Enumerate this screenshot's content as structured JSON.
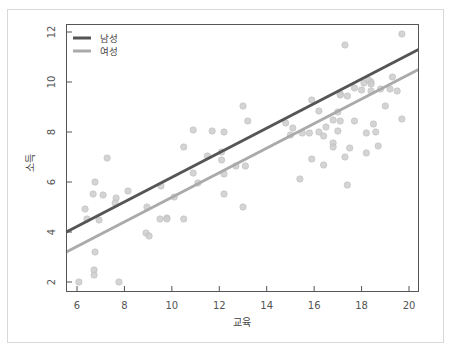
{
  "chart_data": {
    "type": "scatter",
    "title": "",
    "xlabel": "교육",
    "ylabel": "소득",
    "xlim": [
      5.55,
      20.4
    ],
    "ylim": [
      1.6,
      12.3
    ],
    "xticks": [
      6,
      8,
      10,
      12,
      14,
      16,
      18,
      20
    ],
    "yticks": [
      2,
      4,
      6,
      8,
      10,
      12
    ],
    "grid": false,
    "legend_position": "top-left",
    "legend": [
      {
        "label": "남성",
        "color": "#555555"
      },
      {
        "label": "여성",
        "color": "#aaaaaa"
      }
    ],
    "lines": [
      {
        "name": "남성",
        "color": "#555555",
        "x": [
          5.55,
          20.4
        ],
        "y": [
          4.0,
          11.3
        ]
      },
      {
        "name": "여성",
        "color": "#aaaaaa",
        "x": [
          5.55,
          20.4
        ],
        "y": [
          3.2,
          10.5
        ]
      }
    ],
    "points": {
      "color": "#cccccc",
      "x": [
        7.27,
        6.76,
        6.68,
        7.1,
        7.65,
        7.61,
        8.15,
        9.54,
        6.34,
        6.42,
        6.93,
        8.95,
        8.91,
        9.04,
        9.5,
        9.79,
        6.76,
        6.72,
        6.72,
        6.08,
        7.77,
        13.0,
        13.2,
        10.9,
        11.7,
        12.2,
        10.5,
        12.1,
        11.5,
        12.1,
        13.1,
        12.7,
        10.9,
        12.2,
        11.1,
        12.2,
        13.0,
        9.79,
        10.5,
        10.1,
        15.9,
        17.7,
        18.1,
        18.4,
        16.2,
        17.0,
        16.8,
        15.8,
        16.4,
        16.8,
        14.8,
        15.1,
        16.5,
        17.7,
        15.0,
        15.5,
        16.2,
        16.8,
        17.5,
        17.3,
        15.9,
        16.4,
        15.4,
        17.4,
        19.7,
        17.3,
        19.3,
        18.3,
        17.1,
        17.4,
        17.1,
        18.0,
        19.0,
        18.4,
        18.8,
        19.2,
        19.5,
        18.4,
        18.5,
        17.1,
        19.7,
        17.0,
        18.6,
        18.2,
        18.7,
        18.2
      ],
      "y": [
        6.96,
        6.0,
        5.52,
        5.48,
        5.36,
        5.16,
        5.64,
        5.84,
        4.92,
        4.52,
        4.48,
        5.0,
        3.96,
        3.84,
        4.52,
        4.56,
        3.2,
        2.48,
        2.28,
        2.0,
        2.0,
        9.04,
        8.44,
        8.08,
        8.04,
        8.0,
        7.4,
        7.2,
        7.04,
        6.88,
        6.64,
        6.64,
        6.36,
        6.32,
        5.96,
        5.52,
        5.0,
        4.52,
        4.52,
        5.4,
        9.28,
        9.76,
        9.96,
        10.0,
        8.84,
        8.8,
        8.48,
        7.96,
        7.84,
        7.56,
        8.36,
        8.16,
        8.2,
        8.44,
        7.88,
        7.96,
        8.0,
        7.4,
        7.36,
        7.0,
        6.92,
        6.68,
        6.12,
        5.88,
        11.92,
        11.48,
        10.2,
        10.08,
        9.52,
        9.44,
        9.48,
        9.68,
        9.04,
        9.64,
        9.72,
        9.72,
        9.64,
        9.92,
        8.32,
        8.44,
        8.52,
        8.04,
        8.0,
        7.96,
        7.44,
        7.16
      ]
    }
  }
}
